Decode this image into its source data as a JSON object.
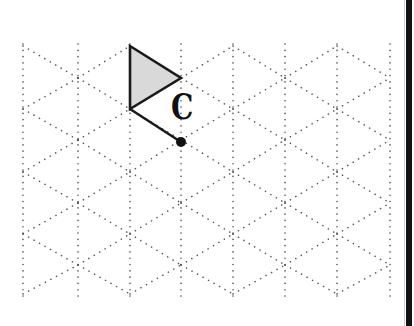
{
  "figure": {
    "type": "isometric-dot-grid-diagram",
    "grid": {
      "columns_x": [
        23,
        78,
        130,
        181,
        233,
        285,
        337,
        390
      ],
      "even_column_vertices_y": [
        46,
        109,
        172,
        234,
        294
      ],
      "odd_column_vertices_y": [
        78,
        140,
        203,
        265
      ],
      "top_y": 44,
      "bottom_y": 297,
      "dot_color": "#555555",
      "line_style": "dotted"
    },
    "shape": {
      "name": "flag-triangle",
      "vertices": [
        [
          130,
          46
        ],
        [
          181,
          78
        ],
        [
          130,
          109
        ]
      ],
      "fill": "#d9d9d9",
      "stroke": "#1a1a1a"
    },
    "pole_segment": {
      "from": [
        130,
        109
      ],
      "to": [
        181,
        142
      ]
    },
    "point": {
      "x": 181,
      "y": 142,
      "r": 5,
      "color": "#111111"
    },
    "label": {
      "text": "C"
    },
    "border": {
      "side": "right",
      "color": "#111111"
    }
  }
}
